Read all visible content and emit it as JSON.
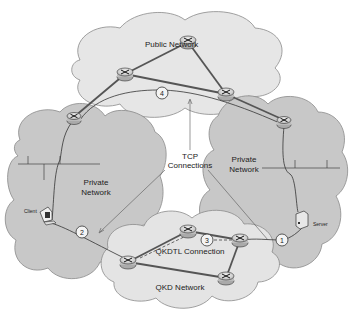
{
  "diagram": {
    "clouds": [
      {
        "id": "public",
        "label": "Public Network"
      },
      {
        "id": "private-left",
        "label_line1": "Private",
        "label_line2": "Network"
      },
      {
        "id": "private-right",
        "label_line1": "Private",
        "label_line2": "Network"
      },
      {
        "id": "qkd",
        "label": "QKD Network"
      }
    ],
    "annotations": {
      "tcp_line1": "TCP",
      "tcp_line2": "Connections",
      "qkdtl": "QKDTL Connection"
    },
    "endpoints": {
      "client": "Client",
      "server": "Server"
    },
    "connection_markers": [
      "1",
      "2",
      "3",
      "4"
    ],
    "colors": {
      "cloud_fill": "#c8c8c8",
      "cloud_fill_light": "#e4e4e4",
      "cloud_stroke": "#8a8a8a",
      "link": "#555555",
      "tcp_path": "#333333"
    }
  }
}
